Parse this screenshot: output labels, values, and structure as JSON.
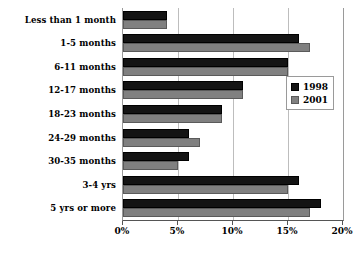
{
  "chart_data": {
    "type": "bar",
    "orientation": "horizontal",
    "title": "",
    "xlabel": "",
    "ylabel": "",
    "xlim": [
      0,
      20
    ],
    "x_tick_labels": [
      "0%",
      "5%",
      "10%",
      "15%",
      "20%"
    ],
    "x_tick_values": [
      0,
      5,
      10,
      15,
      20
    ],
    "grid": true,
    "legend_position": "right-inside",
    "categories": [
      "Less than 1 month",
      "1-5 months",
      "6-11 months",
      "12-17 months",
      "18-23 months",
      "24-29 months",
      "30-35 months",
      "3-4 yrs",
      "5 yrs or more"
    ],
    "series": [
      {
        "name": "1998",
        "color": "#141414",
        "values": [
          4.0,
          16.0,
          15.0,
          10.9,
          9.0,
          6.0,
          6.0,
          16.0,
          18.0
        ]
      },
      {
        "name": "2001",
        "color": "#808080",
        "values": [
          4.0,
          17.0,
          15.0,
          10.9,
          9.0,
          7.0,
          5.0,
          15.0,
          17.0
        ]
      }
    ]
  }
}
